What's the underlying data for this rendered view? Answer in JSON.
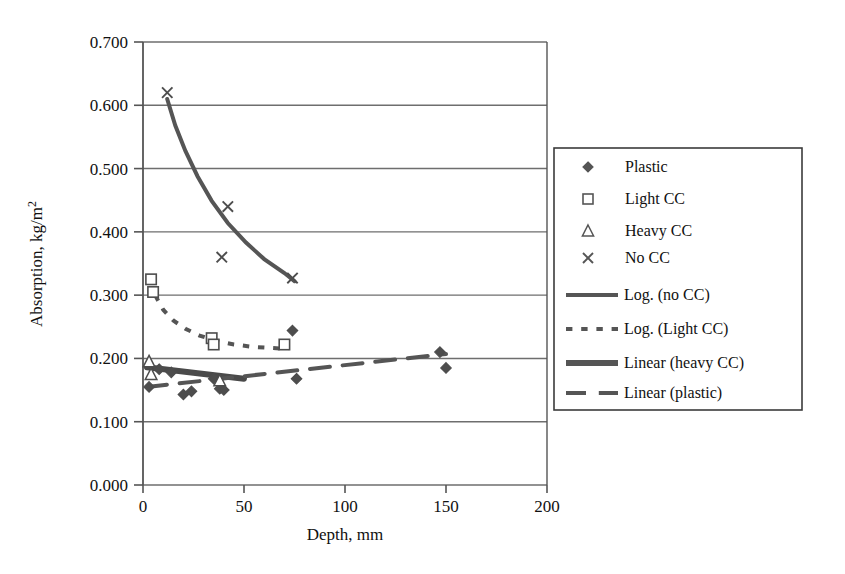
{
  "chart_data": {
    "type": "scatter",
    "title": "",
    "xlabel": "Depth, mm",
    "ylabel": "Absorption, kg/m²",
    "xlim": [
      0,
      200
    ],
    "ylim": [
      0.0,
      0.7
    ],
    "xticks": [
      "0",
      "50",
      "100",
      "150",
      "200"
    ],
    "xtick_values": [
      0,
      50,
      100,
      150,
      200
    ],
    "yticks": [
      "0.000",
      "0.100",
      "0.200",
      "0.300",
      "0.400",
      "0.500",
      "0.600",
      "0.700"
    ],
    "ytick_values": [
      0.0,
      0.1,
      0.2,
      0.3,
      0.4,
      0.5,
      0.6,
      0.7
    ],
    "grid": "horizontal",
    "legend_position": "right-outside",
    "series": [
      {
        "name": "Plastic",
        "marker": "filled-diamond",
        "color": "#4d4d4d",
        "points": [
          {
            "x": 3,
            "y": 0.155
          },
          {
            "x": 8,
            "y": 0.183
          },
          {
            "x": 14,
            "y": 0.178
          },
          {
            "x": 20,
            "y": 0.143
          },
          {
            "x": 24,
            "y": 0.148
          },
          {
            "x": 35,
            "y": 0.168
          },
          {
            "x": 38,
            "y": 0.152
          },
          {
            "x": 40,
            "y": 0.15
          },
          {
            "x": 74,
            "y": 0.244
          },
          {
            "x": 76,
            "y": 0.168
          },
          {
            "x": 147,
            "y": 0.21
          },
          {
            "x": 150,
            "y": 0.185
          }
        ]
      },
      {
        "name": "Light CC",
        "marker": "open-square",
        "color": "#4d4d4d",
        "points": [
          {
            "x": 4,
            "y": 0.325
          },
          {
            "x": 5,
            "y": 0.305
          },
          {
            "x": 34,
            "y": 0.232
          },
          {
            "x": 35,
            "y": 0.222
          },
          {
            "x": 70,
            "y": 0.222
          }
        ]
      },
      {
        "name": "Heavy CC",
        "marker": "open-triangle",
        "color": "#4d4d4d",
        "points": [
          {
            "x": 3,
            "y": 0.195
          },
          {
            "x": 4,
            "y": 0.175
          },
          {
            "x": 38,
            "y": 0.165
          }
        ]
      },
      {
        "name": "No CC",
        "marker": "cross-x",
        "color": "#4d4d4d",
        "points": [
          {
            "x": 12,
            "y": 0.62
          },
          {
            "x": 42,
            "y": 0.44
          },
          {
            "x": 39,
            "y": 0.36
          },
          {
            "x": 74,
            "y": 0.327
          }
        ]
      }
    ],
    "trendlines": [
      {
        "name": "Log. (no CC)",
        "style": "solid",
        "width": 4,
        "color": "#555555",
        "path": [
          {
            "x": 12,
            "y": 0.61
          },
          {
            "x": 16,
            "y": 0.568
          },
          {
            "x": 21,
            "y": 0.528
          },
          {
            "x": 27,
            "y": 0.488
          },
          {
            "x": 34,
            "y": 0.449
          },
          {
            "x": 42,
            "y": 0.414
          },
          {
            "x": 51,
            "y": 0.383
          },
          {
            "x": 60,
            "y": 0.357
          },
          {
            "x": 70,
            "y": 0.335
          },
          {
            "x": 75,
            "y": 0.322
          }
        ]
      },
      {
        "name": "Log. (Light CC)",
        "style": "dotted",
        "width": 4,
        "color": "#555555",
        "path": [
          {
            "x": 6,
            "y": 0.3
          },
          {
            "x": 10,
            "y": 0.277
          },
          {
            "x": 15,
            "y": 0.26
          },
          {
            "x": 21,
            "y": 0.247
          },
          {
            "x": 28,
            "y": 0.236
          },
          {
            "x": 36,
            "y": 0.228
          },
          {
            "x": 45,
            "y": 0.222
          },
          {
            "x": 55,
            "y": 0.218
          },
          {
            "x": 66,
            "y": 0.216
          },
          {
            "x": 72,
            "y": 0.215
          }
        ]
      },
      {
        "name": "Linear (heavy CC)",
        "style": "solid-thick",
        "width": 6,
        "color": "#4a4a4a",
        "path": [
          {
            "x": 2,
            "y": 0.186
          },
          {
            "x": 50,
            "y": 0.168
          }
        ]
      },
      {
        "name": "Linear (plastic)",
        "style": "dashed",
        "width": 4,
        "color": "#555555",
        "path": [
          {
            "x": 2,
            "y": 0.155
          },
          {
            "x": 150,
            "y": 0.207
          }
        ]
      }
    ]
  },
  "legend": {
    "entries": [
      {
        "label": "Plastic",
        "kind": "marker",
        "marker": "filled-diamond"
      },
      {
        "label": "Light CC",
        "kind": "marker",
        "marker": "open-square"
      },
      {
        "label": "Heavy CC",
        "kind": "marker",
        "marker": "open-triangle"
      },
      {
        "label": "No CC",
        "kind": "marker",
        "marker": "cross-x"
      },
      {
        "label": "Log. (no CC)",
        "kind": "line",
        "style": "solid"
      },
      {
        "label": "Log. (Light CC)",
        "kind": "line",
        "style": "dotted"
      },
      {
        "label": "Linear (heavy CC)",
        "kind": "line",
        "style": "solid-thick"
      },
      {
        "label": "Linear (plastic)",
        "kind": "line",
        "style": "dashed"
      }
    ]
  },
  "colors": {
    "ink": "#1a1a1a",
    "line": "#555555",
    "grid": "#6e6e6e",
    "axis": "#555555",
    "background": "#ffffff"
  }
}
